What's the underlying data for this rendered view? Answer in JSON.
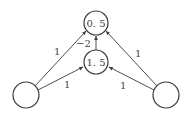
{
  "diagram": {
    "type": "neural-network",
    "nodes": [
      {
        "id": "input-left",
        "label": ""
      },
      {
        "id": "input-right",
        "label": ""
      },
      {
        "id": "hidden",
        "label": "1. 5"
      },
      {
        "id": "output",
        "label": "0. 5"
      }
    ],
    "edges": [
      {
        "from": "input-left",
        "to": "output",
        "weight": "1"
      },
      {
        "from": "input-left",
        "to": "hidden",
        "weight": "1"
      },
      {
        "from": "input-right",
        "to": "output",
        "weight": "1"
      },
      {
        "from": "input-right",
        "to": "hidden",
        "weight": "1"
      },
      {
        "from": "hidden",
        "to": "output",
        "weight": "−2"
      }
    ]
  }
}
